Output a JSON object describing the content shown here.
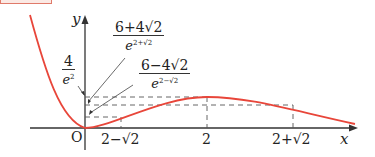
{
  "diagram": {
    "type": "function-graph",
    "function_description": "curve touching origin at x=0, local max at x=2 with value 4/e^2, inflection points at x=2-sqrt2 and x=2+sqrt2",
    "colors": {
      "curve": "#e8463a",
      "axes": "#333333",
      "dashes": "#555555",
      "header_box": "#e07a6a"
    },
    "axes": {
      "x_label": "x",
      "y_label": "y",
      "origin_label": "O"
    },
    "x_ticks": [
      "2−√2",
      "2",
      "2+√2"
    ],
    "y_annotations": [
      {
        "numerator": "4",
        "denominator_base": "e",
        "denominator_exp": "2"
      },
      {
        "numerator": "6+4√2",
        "denominator_base": "e",
        "denominator_exp": "2+√2"
      },
      {
        "numerator": "6−4√2",
        "denominator_base": "e",
        "denominator_exp": "2−√2"
      }
    ]
  }
}
